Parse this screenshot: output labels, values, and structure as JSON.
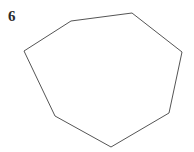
{
  "figure": {
    "label": "6",
    "label_color": "#2b2b2b",
    "background_color": "#ffffff",
    "shape": {
      "name": "heptagon",
      "sides": 7,
      "stroke_color": "#555555",
      "stroke_width": 1,
      "fill": "none",
      "points": "71,21 132,13 182,52 169,113 111,147 55,116 24,51",
      "vertices": [
        {
          "x": 71,
          "y": 21
        },
        {
          "x": 132,
          "y": 13
        },
        {
          "x": 182,
          "y": 52
        },
        {
          "x": 169,
          "y": 113
        },
        {
          "x": 111,
          "y": 147
        },
        {
          "x": 55,
          "y": 116
        },
        {
          "x": 24,
          "y": 51
        }
      ]
    },
    "canvas": {
      "width": 194,
      "height": 152
    }
  }
}
